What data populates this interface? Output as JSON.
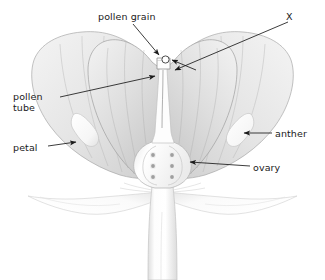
{
  "diagram": {
    "background_color": "#ffffff",
    "line_color": "#1a1a1a",
    "petal_fill_light": "#efefef",
    "petal_fill_dark": "#c9c9c9",
    "petal_stroke": "#9a9a9a",
    "stem_fill": "#fbfbfb",
    "stem_stroke": "#b8b8b8",
    "anther_fill": "#fcfcfc",
    "ovule_fill": "#9f9f9f",
    "ovule_ring": "#ededed"
  },
  "labels": [
    {
      "id": "pollen-grain",
      "text": "pollen grain",
      "x": 98,
      "y": 11,
      "leader": "two-arrows-to-stigma"
    },
    {
      "id": "x",
      "text": "X",
      "x": 286,
      "y": 11,
      "leader": "long-arrow-to-style-top"
    },
    {
      "id": "pollen-tube",
      "text": "pollen\ntube",
      "line1": "pollen",
      "line2": "tube",
      "x": 13,
      "y": 91,
      "leader": "long-arrow-to-style-interior"
    },
    {
      "id": "petal",
      "text": "petal",
      "x": 13,
      "y": 142,
      "leader": "arrow-to-left-petal"
    },
    {
      "id": "anther",
      "text": "anther",
      "x": 275,
      "y": 128,
      "leader": "arrow-to-right-anther"
    },
    {
      "id": "ovary",
      "text": "ovary",
      "x": 253,
      "y": 162,
      "leader": "arrow-to-ovary"
    }
  ],
  "structures": {
    "petals": 4,
    "anthers": 2,
    "ovules": 6,
    "ovule_rows": 3,
    "ovule_columns": 2,
    "pollen_grains": 1,
    "sepals": 2,
    "stem": 1,
    "style": 1,
    "stigma": 1
  }
}
